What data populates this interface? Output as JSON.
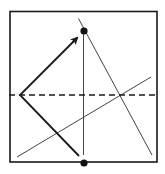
{
  "diagram": {
    "type": "folding-diagram",
    "colors": {
      "background": "#ffffff",
      "stroke": "#1a1a1a",
      "thin_stroke": "#444444"
    },
    "square": {
      "x1": 10,
      "y1": 11.5,
      "x2": 157,
      "y2": 162
    },
    "vertical_line": {
      "x1": 83.5,
      "y1": 31,
      "x2": 83.5,
      "y2": 155
    },
    "dashed_line": {
      "x1": 9,
      "y1": 95,
      "x2": 158,
      "y2": 95,
      "dash": "6 4"
    },
    "long_diagonal": {
      "x1": 78.5,
      "y1": 18.5,
      "x2": 152,
      "y2": 155
    },
    "rising_line": {
      "x1": 17,
      "y1": 157,
      "x2": 151,
      "y2": 77
    },
    "arrow": {
      "vertex": {
        "x": 20,
        "y": 95
      },
      "upper_end": {
        "x": 77,
        "y": 38
      },
      "lower_end": {
        "x": 79,
        "y": 156
      }
    },
    "points": [
      {
        "name": "top-point",
        "x": 84,
        "y": 31,
        "r": 3.6
      },
      {
        "name": "bottom-point",
        "x": 84,
        "y": 163,
        "r": 3.6
      }
    ]
  }
}
